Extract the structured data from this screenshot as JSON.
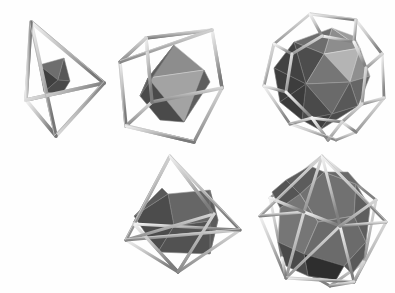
{
  "figure": {
    "kind": "photograph",
    "background_color": "#fefefe",
    "width": 395,
    "height": 293
  },
  "palette": {
    "strut_light": "#e8e8e8",
    "strut_mid": "#a9a9a9",
    "strut_dark": "#6b6b6b",
    "strut_outline": "#8a8a8a",
    "face_lightest": "#b9b9b9",
    "face_light": "#9a9a9a",
    "face_mid": "#7d7d7d",
    "face_dark": "#5c5c5c",
    "face_darkest": "#3f3f3f",
    "face_edge": "#d8d8d8"
  },
  "models": [
    {
      "id": "tetrahedron-in-tetrahedron",
      "position": "top-left",
      "cage_name": "tetrahedron",
      "inner_name": "tetrahedron",
      "cage_vertices": 4,
      "cage_edges": 6,
      "cage_faces": 4,
      "inner_faces": 4,
      "x": 8,
      "y": 8,
      "w": 110,
      "h": 136
    },
    {
      "id": "octahedron-in-cube",
      "position": "top-middle",
      "cage_name": "cube",
      "inner_name": "octahedron",
      "cage_vertices": 8,
      "cage_edges": 12,
      "cage_faces": 6,
      "inner_faces": 8,
      "x": 112,
      "y": 18,
      "w": 128,
      "h": 128
    },
    {
      "id": "icosahedron-in-dodecahedron",
      "position": "top-right",
      "cage_name": "dodecahedron",
      "inner_name": "icosahedron",
      "cage_vertices": 20,
      "cage_edges": 30,
      "cage_faces": 12,
      "inner_faces": 20,
      "x": 250,
      "y": 6,
      "w": 142,
      "h": 142
    },
    {
      "id": "cube-in-octahedron",
      "position": "bottom-middle",
      "cage_name": "octahedron",
      "inner_name": "cube",
      "cage_vertices": 6,
      "cage_edges": 12,
      "cage_faces": 8,
      "inner_faces": 6,
      "x": 118,
      "y": 148,
      "w": 132,
      "h": 140
    },
    {
      "id": "dodecahedron-in-icosahedron",
      "position": "bottom-right",
      "cage_name": "icosahedron",
      "inner_name": "dodecahedron",
      "cage_vertices": 12,
      "cage_edges": 30,
      "cage_faces": 20,
      "inner_faces": 12,
      "x": 252,
      "y": 150,
      "w": 142,
      "h": 142
    }
  ]
}
